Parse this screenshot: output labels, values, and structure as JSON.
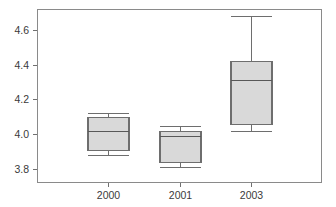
{
  "chart_data": {
    "type": "box",
    "title": "",
    "xlabel": "",
    "ylabel": "",
    "categories": [
      "2000",
      "2001",
      "2003"
    ],
    "ylim": [
      3.72,
      4.72
    ],
    "yticks": [
      3.8,
      4.0,
      4.2,
      4.4,
      4.6
    ],
    "ytick_labels": [
      "3.8",
      "4.0",
      "4.2",
      "4.4",
      "4.6"
    ],
    "grid": false,
    "legend": null,
    "boxes": [
      {
        "category": "2000",
        "whisker_low": 3.88,
        "q1": 3.91,
        "median": 4.02,
        "q3": 4.1,
        "whisker_high": 4.12,
        "outliers": []
      },
      {
        "category": "2001",
        "whisker_low": 3.81,
        "q1": 3.84,
        "median": 3.99,
        "q3": 4.02,
        "whisker_high": 4.05,
        "outliers": []
      },
      {
        "category": "2003",
        "whisker_low": 4.02,
        "q1": 4.06,
        "median": 4.31,
        "q3": 4.42,
        "whisker_high": 4.68,
        "outliers": []
      }
    ],
    "style": {
      "box_fill": "#d9d9d9",
      "box_edge": "#6e6e6e",
      "median_color": "#585858",
      "whisker_color": "#6e6e6e",
      "frame_color": "#8a8a8a",
      "background": "#ffffff",
      "tick_color": "#707070",
      "label_color": "#3a3a3a"
    },
    "geometry": {
      "frame": {
        "left": 37,
        "right": 322,
        "top": 9,
        "bottom": 183
      },
      "box_width": 41,
      "cap_width": 41,
      "centers": [
        108,
        180,
        251
      ]
    }
  }
}
